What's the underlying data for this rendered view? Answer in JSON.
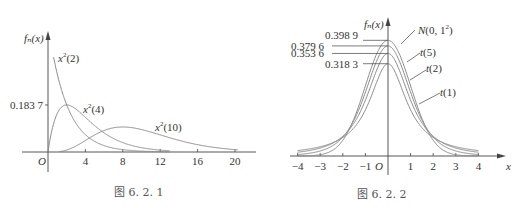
{
  "chart_data": [
    {
      "type": "line",
      "caption": "图 6. 2. 1",
      "ylabel": "fn(x)",
      "xlabel": "x",
      "origin_label": "O",
      "x_ticks": [
        4,
        8,
        12,
        16,
        20
      ],
      "y_ticks": [
        0.1837
      ],
      "y_tick_labels": [
        "0.183 7"
      ],
      "xlim": [
        0,
        22
      ],
      "ylim": [
        0,
        0.5
      ],
      "grid": false,
      "series": [
        {
          "name": "χ²(2)",
          "label": "x²(2)",
          "df": 2,
          "peak": null
        },
        {
          "name": "χ²(4)",
          "label": "x²(4)",
          "df": 4,
          "peak": [
            2,
            0.1837
          ]
        },
        {
          "name": "χ²(10)",
          "label": "x²(10)",
          "df": 10,
          "peak": [
            8,
            0.0977
          ]
        }
      ]
    },
    {
      "type": "line",
      "caption": "图 6. 2. 2",
      "ylabel": "fn(x)",
      "xlabel": "x",
      "origin_label": "O",
      "x_ticks": [
        -4,
        -3,
        -2,
        -1,
        1,
        2,
        3,
        4
      ],
      "y_ticks": [
        0.3989,
        0.3796,
        0.3536,
        0.3183
      ],
      "y_tick_labels": [
        "0.398 9",
        "0.379 6",
        "0.353 6",
        "0.318 3"
      ],
      "xlim": [
        -4.3,
        4.8
      ],
      "ylim": [
        0,
        0.45
      ],
      "grid": false,
      "series": [
        {
          "name": "N(0, 1²)",
          "peak": 0.3989
        },
        {
          "name": "t(5)",
          "peak": 0.3796
        },
        {
          "name": "t(2)",
          "peak": 0.3536
        },
        {
          "name": "t(1)",
          "peak": 0.3183
        }
      ]
    }
  ]
}
